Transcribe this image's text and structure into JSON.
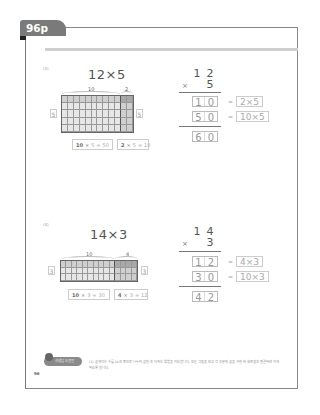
{
  "page": {
    "tab_label": "96p",
    "page_number": "96"
  },
  "colors": {
    "tab": "#7a7a7a",
    "grid_light": "#e6e6e6",
    "grid_mid": "#cfcfcf",
    "grid_dark": "#a8a8a8",
    "accent_bar": "#cfcfcf"
  },
  "problems": [
    {
      "label": "(3)",
      "title": "12×5",
      "tens_label": "10",
      "ones_label": "2",
      "rows": 5,
      "tens_cols": 10,
      "ones_cols": 2,
      "left_side": "5",
      "right_side": "5",
      "eq1": {
        "a": "10",
        "op": "×",
        "b": "5",
        "eq": "=",
        "result": "50"
      },
      "eq2": {
        "a": "2",
        "op": "×",
        "b": "5",
        "eq": "=",
        "result": "10"
      },
      "vertical": {
        "top": [
          "1",
          "2"
        ],
        "times_sign": "×",
        "multiplier": "5",
        "partial1": [
          "1",
          "0"
        ],
        "partial1_expr": "2×5",
        "partial2": [
          "5",
          "0"
        ],
        "partial2_expr": "10×5",
        "total": [
          "6",
          "0"
        ],
        "equals": "="
      }
    },
    {
      "label": "(4)",
      "title": "14×3",
      "tens_label": "10",
      "ones_label": "4",
      "rows": 3,
      "tens_cols": 10,
      "ones_cols": 4,
      "left_side": "3",
      "right_side": "3",
      "eq1": {
        "a": "10",
        "op": "×",
        "b": "3",
        "eq": "=",
        "result": "30"
      },
      "eq2": {
        "a": "4",
        "op": "×",
        "b": "3",
        "eq": "=",
        "result": "12"
      },
      "vertical": {
        "top": [
          "1",
          "4"
        ],
        "times_sign": "×",
        "multiplier": "3",
        "partial1": [
          "1",
          "2"
        ],
        "partial1_expr": "4×3",
        "partial2": [
          "3",
          "0"
        ],
        "partial2_expr": "10×3",
        "total": [
          "4",
          "2"
        ],
        "equals": "="
      }
    }
  ],
  "footer": {
    "icon_label": "선생님 도움말",
    "text": "(3) 곱해지는 수를 10과 몇으로 나누어 곱한 후 더하는 방법을 지도합니다. 모눈 그림을 보고 각 부분의 곱을 구한 뒤 세로셈과 연결하여 이해하도록 합니다."
  }
}
